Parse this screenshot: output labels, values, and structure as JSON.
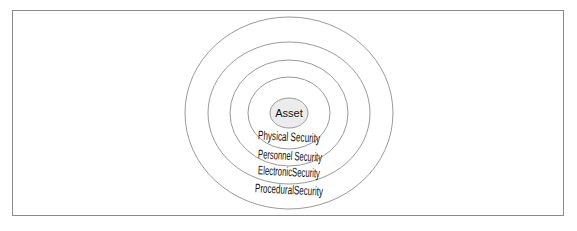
{
  "diagram": {
    "type": "concentric-layers",
    "center": {
      "label": "Asset",
      "fill": "#ececec"
    },
    "layers": [
      {
        "label": "Physical Security"
      },
      {
        "label": "Personnel Security"
      },
      {
        "label": "ElectronicSecurity"
      },
      {
        "label": "ProceduralSecurity"
      }
    ],
    "colors": {
      "ring_stroke": "#9a9a9a",
      "frame_stroke": "#8a8a8a",
      "text": "#111111"
    }
  }
}
